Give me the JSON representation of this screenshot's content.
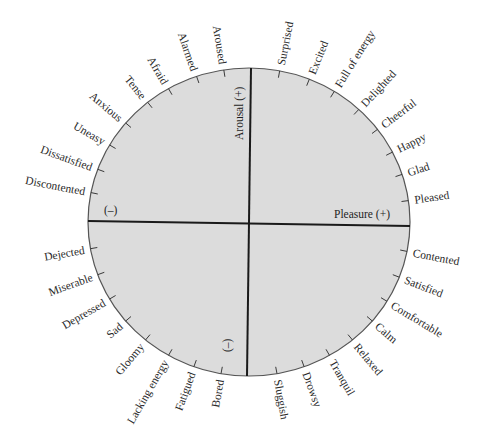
{
  "diagram": {
    "colors": {
      "fill": "#dcdcdc",
      "outline": "#555555",
      "axis": "#1a1a1a",
      "text": "#2a2a2a"
    },
    "axes": {
      "vertical_label": "Arousal (+)",
      "horizontal_label": "Pleasure (+)",
      "left_minus": "(–)",
      "bottom_minus": "(–)"
    },
    "labels": [
      {
        "text": "Pleased",
        "angle": 8
      },
      {
        "text": "Glad",
        "angle": 18
      },
      {
        "text": "Happy",
        "angle": 27
      },
      {
        "text": "Cheerful",
        "angle": 37
      },
      {
        "text": "Delighted",
        "angle": 47
      },
      {
        "text": "Full of energy",
        "angle": 58
      },
      {
        "text": "Excited",
        "angle": 68
      },
      {
        "text": "Surprised",
        "angle": 79
      },
      {
        "text": "Aroused",
        "angle": 99
      },
      {
        "text": "Alarmed",
        "angle": 109
      },
      {
        "text": "Afraid",
        "angle": 120
      },
      {
        "text": "Tense",
        "angle": 129
      },
      {
        "text": "Anxious",
        "angle": 140
      },
      {
        "text": "Uneasy",
        "angle": 150
      },
      {
        "text": "Dissatisfied",
        "angle": 160
      },
      {
        "text": "Discontented",
        "angle": 169
      },
      {
        "text": "Dejected",
        "angle": 190
      },
      {
        "text": "Miserable",
        "angle": 200
      },
      {
        "text": "Depressed",
        "angle": 210
      },
      {
        "text": "Sad",
        "angle": 220
      },
      {
        "text": "Gloomy",
        "angle": 230
      },
      {
        "text": "Lacking energy",
        "angle": 240
      },
      {
        "text": "Fatigued",
        "angle": 250
      },
      {
        "text": "Bored",
        "angle": 260
      },
      {
        "text": "Sluggish",
        "angle": 280
      },
      {
        "text": "Drowsy",
        "angle": 290
      },
      {
        "text": "Tranquil",
        "angle": 300
      },
      {
        "text": "Relaxed",
        "angle": 310
      },
      {
        "text": "Calm",
        "angle": 320
      },
      {
        "text": "Comfortable",
        "angle": 329
      },
      {
        "text": "Satisfied",
        "angle": 339
      },
      {
        "text": "Contented",
        "angle": 349
      }
    ]
  }
}
